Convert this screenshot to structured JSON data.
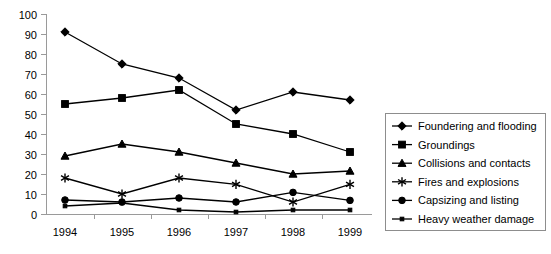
{
  "chart_data": {
    "type": "line",
    "title": "",
    "xlabel": "",
    "ylabel": "",
    "categories": [
      "1994",
      "1995",
      "1996",
      "1997",
      "1998",
      "1999"
    ],
    "ylim": [
      0,
      100
    ],
    "yticks": [
      0,
      10,
      20,
      30,
      40,
      50,
      60,
      70,
      80,
      90,
      100
    ],
    "grid": false,
    "legend_position": "right",
    "series": [
      {
        "name": "Foundering and flooding",
        "marker": "diamond",
        "values": [
          91,
          75,
          68,
          52,
          61,
          57
        ]
      },
      {
        "name": "Groundings",
        "marker": "square",
        "values": [
          55,
          58,
          62,
          45,
          40,
          31
        ]
      },
      {
        "name": "Collisions and contacts",
        "marker": "triangle",
        "values": [
          29,
          35,
          31,
          25.5,
          20,
          21.5
        ]
      },
      {
        "name": "Fires and explosions",
        "marker": "asterisk",
        "values": [
          18,
          10,
          18,
          14.8,
          6,
          14.8
        ]
      },
      {
        "name": "Capsizing and listing",
        "marker": "circle",
        "values": [
          7,
          6,
          8,
          6,
          10.8,
          6.8
        ]
      },
      {
        "name": "Heavy weather damage",
        "marker": "dash",
        "values": [
          4,
          5.5,
          2,
          1,
          2,
          2
        ]
      }
    ]
  },
  "colors": {
    "series_stroke": "#000000",
    "axis": "#9a9a9a",
    "legend_border": "#8d8d8d",
    "background": "#ffffff"
  }
}
